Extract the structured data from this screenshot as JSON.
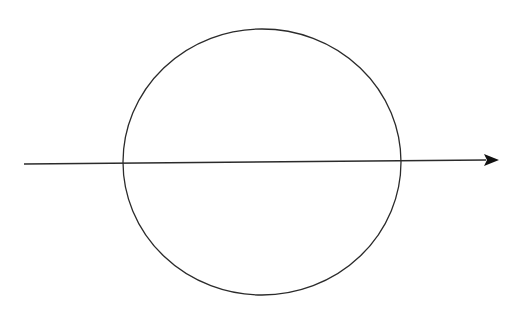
{
  "diagram": {
    "background": "#ffffff",
    "stroke_color": "#2b2b2b",
    "circle": {
      "cx": 262,
      "cy": 162,
      "rx": 139,
      "ry": 133,
      "stroke_width": 1.3
    },
    "arrow": {
      "x1": 24,
      "y1": 164,
      "x2": 486,
      "y2": 160,
      "tip_x": 499,
      "tip_y": 160,
      "stroke_width": 1.3
    }
  }
}
